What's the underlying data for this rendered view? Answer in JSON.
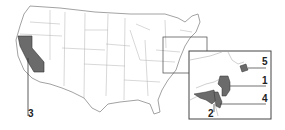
{
  "map": {
    "title": "United States map with highlighted states",
    "highlight_color": "#6b6b6b",
    "border_color": "#9a9a9a",
    "callouts": [
      {
        "id": "1",
        "label": "1",
        "region": "New Jersey"
      },
      {
        "id": "2",
        "label": "2",
        "region": "Maryland"
      },
      {
        "id": "3",
        "label": "3",
        "region": "California"
      },
      {
        "id": "4",
        "label": "4",
        "region": "Delaware"
      },
      {
        "id": "5",
        "label": "5",
        "region": "Rhode Island"
      }
    ],
    "inset": {
      "description": "Enlarged Northeast / Mid-Atlantic region"
    }
  }
}
